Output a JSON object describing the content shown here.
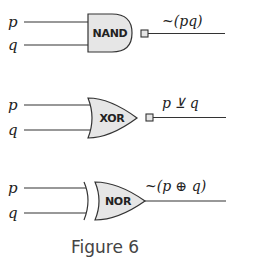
{
  "gates": [
    {
      "type": "NAND",
      "label": "NAND",
      "inputs": [
        "p",
        "q"
      ],
      "output_expression": "~(pq)",
      "has_output_square": true
    },
    {
      "type": "XOR",
      "label": "XOR",
      "inputs": [
        "p",
        "q"
      ],
      "output_expression": "p ⊻ q",
      "has_output_square": true
    },
    {
      "type": "NOR",
      "label": "NOR",
      "inputs": [
        "p",
        "q"
      ],
      "output_expression": "~(p ⊕ q)",
      "has_output_square": false
    }
  ],
  "caption": "Figure 6",
  "colors": {
    "gate_fill": "#e6e6e6",
    "stroke": "#333333",
    "caption": "#444444"
  }
}
